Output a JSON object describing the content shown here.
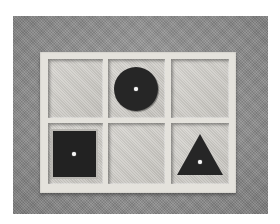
{
  "image": {
    "description": "Grayscale photograph of a wooden tray with six compartments containing geometric inset shapes",
    "background_color": "#8a8a8a",
    "tray_color": "#e4e2dc",
    "shape_color": "#262626",
    "knob_color": "#f4f4f4"
  },
  "tray": {
    "rows": 2,
    "columns": 3,
    "compartments": [
      {
        "row": 1,
        "col": 1,
        "content": "empty"
      },
      {
        "row": 1,
        "col": 2,
        "content": "circle"
      },
      {
        "row": 1,
        "col": 3,
        "content": "empty"
      },
      {
        "row": 2,
        "col": 1,
        "content": "square"
      },
      {
        "row": 2,
        "col": 2,
        "content": "empty"
      },
      {
        "row": 2,
        "col": 3,
        "content": "triangle"
      }
    ]
  }
}
